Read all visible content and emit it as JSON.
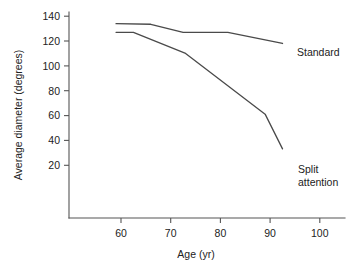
{
  "chart_data": {
    "type": "line",
    "title": "",
    "xlabel": "Age (yr)",
    "ylabel": "Average diameter (degrees)",
    "xlim": [
      52,
      105
    ],
    "ylim": [
      0,
      145
    ],
    "xticks": [
      60,
      70,
      80,
      90,
      100
    ],
    "yticks": [
      20,
      40,
      60,
      80,
      100,
      120,
      140
    ],
    "grid": false,
    "legend_position": "inline-right-of-line-ends",
    "series": [
      {
        "name": "Standard",
        "label_lines": [
          "Standard"
        ],
        "color": "#4a4a4a",
        "x": [
          59,
          66,
          72.5,
          81.5,
          92.5
        ],
        "y": [
          134,
          133.5,
          127,
          127,
          118
        ]
      },
      {
        "name": "Split attention",
        "label_lines": [
          "Split",
          "attention"
        ],
        "color": "#4a4a4a",
        "x": [
          59,
          62.5,
          73,
          89,
          92.5
        ],
        "y": [
          127,
          127,
          110,
          61,
          33
        ]
      }
    ]
  },
  "axis": {
    "x_title": "Age (yr)",
    "y_title": "Average diameter (degrees)",
    "x_tick_labels": [
      "60",
      "70",
      "80",
      "90",
      "100"
    ],
    "y_tick_labels": [
      "20",
      "40",
      "60",
      "80",
      "100",
      "120",
      "140"
    ]
  },
  "labels": {
    "standard": "Standard",
    "split_line1": "Split",
    "split_line2": "attention"
  }
}
